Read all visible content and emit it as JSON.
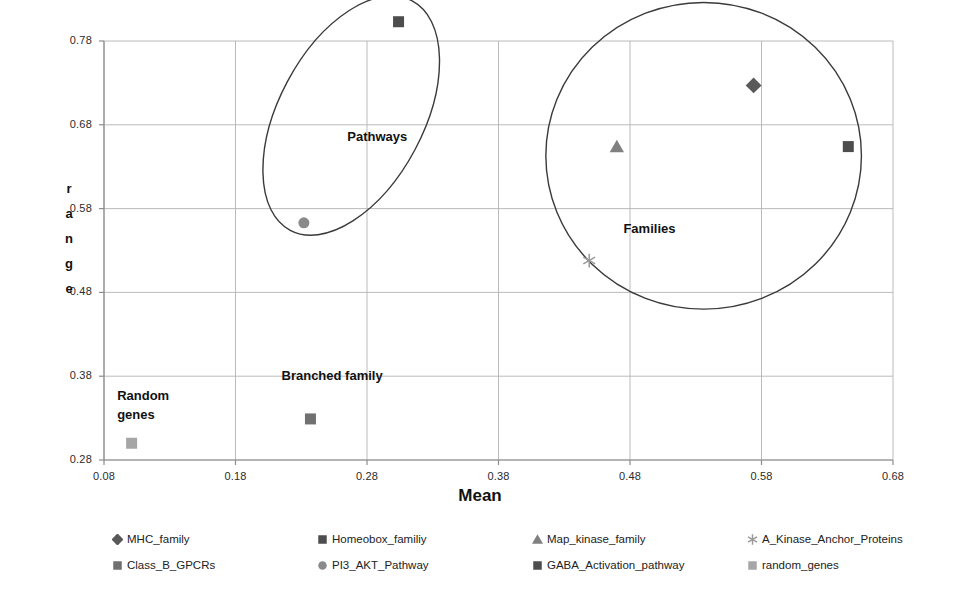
{
  "chart_data": {
    "type": "scatter",
    "title": "",
    "xlabel": "Mean",
    "ylabel": "range",
    "xlim": [
      0.08,
      0.68
    ],
    "ylim": [
      0.28,
      0.78
    ],
    "xticks": [
      "0.08",
      "0.18",
      "0.28",
      "0.38",
      "0.48",
      "0.58",
      "0.68"
    ],
    "yticks": [
      "0.28",
      "0.38",
      "0.48",
      "0.58",
      "0.68",
      "0.78"
    ],
    "xtick_values": [
      0.08,
      0.18,
      0.28,
      0.38,
      0.48,
      0.58,
      0.68
    ],
    "ytick_values": [
      0.28,
      0.38,
      0.48,
      0.58,
      0.68,
      0.78
    ],
    "grid": true,
    "legend_position": "bottom",
    "series": [
      {
        "name": "MHC_family",
        "marker": "diamond",
        "color": "#595959",
        "x": 0.574,
        "y": 0.727
      },
      {
        "name": "Homeobox_familiy",
        "marker": "square",
        "color": "#4d4d4d",
        "x": 0.646,
        "y": 0.654
      },
      {
        "name": "Map_kinase_family",
        "marker": "triangle",
        "color": "#808080",
        "x": 0.47,
        "y": 0.654
      },
      {
        "name": "A_Kinase_Anchor_Proteins",
        "marker": "asterisk",
        "color": "#999999",
        "x": 0.449,
        "y": 0.518
      },
      {
        "name": "Class_B_GPCRs",
        "marker": "square",
        "color": "#707070",
        "x": 0.237,
        "y": 0.329
      },
      {
        "name": "PI3_AKT_Pathway",
        "marker": "circle",
        "color": "#8a8a8a",
        "x": 0.232,
        "y": 0.563
      },
      {
        "name": "GABA_Activation_pathway",
        "marker": "square",
        "color": "#4d4d4d",
        "x": 0.304,
        "y": 0.803
      },
      {
        "name": "random_genes",
        "marker": "square",
        "color": "#a6a6a6",
        "x": 0.101,
        "y": 0.3
      }
    ],
    "annotations": [
      {
        "text": "Pathways",
        "x": 0.265,
        "y": 0.675
      },
      {
        "text": "Families",
        "x": 0.475,
        "y": 0.565
      },
      {
        "text": "Branched family",
        "x": 0.215,
        "y": 0.39
      },
      {
        "text": "Random genes",
        "x": 0.09,
        "y": 0.368
      }
    ],
    "ellipses": [
      {
        "label": "Pathways",
        "cx": 0.268,
        "cy": 0.691,
        "rx": 0.055,
        "ry": 0.155,
        "rotation": 28
      },
      {
        "label": "Families",
        "cx": 0.536,
        "cy": 0.643,
        "rx": 0.12,
        "ry": 0.183,
        "rotation": 0
      }
    ]
  },
  "axes": {
    "x_title": "Mean",
    "y_title_letters": [
      "r",
      "a",
      "n",
      "g",
      "e"
    ],
    "y_ticks": [
      "0.78",
      "0.68",
      "0.58",
      "0.48",
      "0.38",
      "0.28"
    ],
    "x_ticks": [
      "0.08",
      "0.18",
      "0.28",
      "0.38",
      "0.48",
      "0.58",
      "0.68"
    ]
  },
  "annotations": {
    "pathways": "Pathways",
    "families": "Families",
    "branched_family": "Branched family",
    "random_genes": "Random genes"
  },
  "legend": {
    "row1": [
      {
        "label": "MHC_family",
        "marker": "diamond",
        "color": "#595959"
      },
      {
        "label": "Homeobox_familiy",
        "marker": "square",
        "color": "#4d4d4d"
      },
      {
        "label": "Map_kinase_family",
        "marker": "triangle",
        "color": "#808080"
      },
      {
        "label": "A_Kinase_Anchor_Proteins",
        "marker": "asterisk",
        "color": "#999999"
      }
    ],
    "row2": [
      {
        "label": "Class_B_GPCRs",
        "marker": "square",
        "color": "#707070"
      },
      {
        "label": "PI3_AKT_Pathway",
        "marker": "circle",
        "color": "#8a8a8a"
      },
      {
        "label": "GABA_Activation_pathway",
        "marker": "square",
        "color": "#4d4d4d"
      },
      {
        "label": "random_genes",
        "marker": "square",
        "color": "#a6a6a6"
      }
    ]
  },
  "colors": {
    "axis": "#8c8c8c",
    "grid": "#b3b3b3",
    "ellipse": "#3a3a3a",
    "text": "#1a1a1a"
  }
}
